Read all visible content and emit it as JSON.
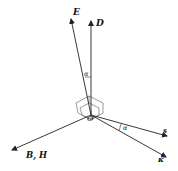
{
  "diagram": {
    "origin_label": "O",
    "vectors": [
      {
        "id": "E",
        "label": "E",
        "bold": true
      },
      {
        "id": "D",
        "label": "D",
        "bold": true
      },
      {
        "id": "BH",
        "label": "B, H",
        "bold": true
      },
      {
        "id": "s",
        "label": "s",
        "bold": true
      },
      {
        "id": "kappa",
        "label": "κ",
        "bold": true
      }
    ],
    "angles": [
      {
        "id": "alpha-ED",
        "label": "α",
        "between": [
          "E",
          "D"
        ]
      },
      {
        "id": "alpha-sk",
        "label": "α",
        "between": [
          "s",
          "kappa"
        ]
      }
    ],
    "colors": {
      "stroke": "#222222",
      "background": "#ffffff",
      "box": "#555555"
    }
  }
}
